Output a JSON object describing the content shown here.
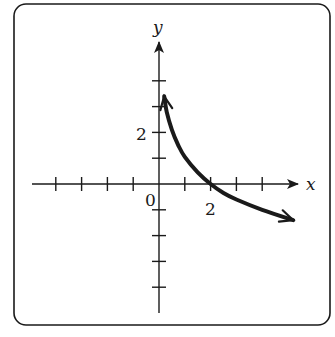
{
  "chart_data": {
    "type": "line",
    "title": "",
    "xlabel": "x",
    "ylabel": "y",
    "origin_label": "0",
    "x_tick_labels": [
      {
        "value": 2,
        "label": "2"
      }
    ],
    "y_tick_labels": [
      {
        "value": 2,
        "label": "2"
      }
    ],
    "x_ticks": [
      -4,
      -3,
      -2,
      -1,
      1,
      2,
      3,
      4
    ],
    "y_ticks": [
      -4,
      -3,
      -2,
      -1,
      1,
      2,
      3,
      4
    ],
    "xlim": [
      -5,
      5.5
    ],
    "ylim": [
      -5,
      5.3
    ],
    "grid": false,
    "frame": "rounded-rectangle",
    "series": [
      {
        "name": "curve",
        "description": "Decreasing curve with vertical asymptote at x=0 (arrow up near x≈0.2, y≈3.4), crossing the x-axis at (2,0), continuing down-right with arrow near (5.2,-1.4)",
        "x": [
          0.2,
          0.3,
          0.5,
          0.75,
          1,
          1.5,
          2,
          2.5,
          3,
          4,
          5.2
        ],
        "y": [
          3.4,
          2.8,
          2.1,
          1.5,
          1.05,
          0.45,
          0,
          -0.35,
          -0.6,
          -1.0,
          -1.4
        ],
        "arrow_ends": true
      }
    ]
  },
  "colors": {
    "ink": "#1a1a1a",
    "background": "#ffffff"
  }
}
